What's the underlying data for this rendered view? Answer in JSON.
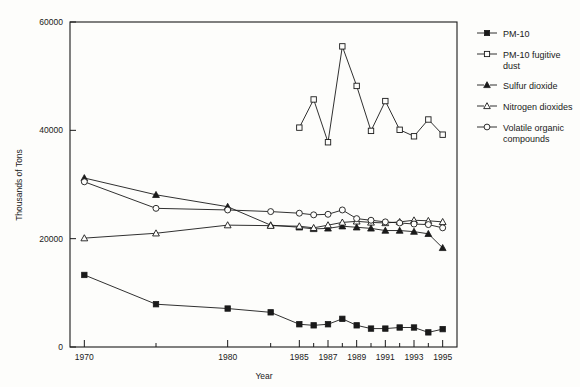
{
  "chart_data": {
    "type": "line",
    "title": "",
    "xlabel": "Year",
    "ylabel": "Thousands of Tons",
    "xlim": [
      1969,
      1996
    ],
    "ylim": [
      0,
      60000
    ],
    "yticks": [
      0,
      20000,
      40000,
      60000
    ],
    "ytick_labels": [
      "0",
      "20000",
      "40000",
      "60000"
    ],
    "xticks": [
      1970,
      1975,
      1980,
      1983,
      1985,
      1986,
      1987,
      1988,
      1989,
      1990,
      1991,
      1992,
      1993,
      1994,
      1995
    ],
    "xtick_labels": [
      "1970",
      "",
      "1980",
      "",
      "1985",
      "",
      "1987",
      "",
      "1989",
      "",
      "1991",
      "",
      "1993",
      "",
      "1995"
    ],
    "grid": false,
    "legend_position": "right",
    "series": [
      {
        "name": "PM-10",
        "marker": "filled-square",
        "x": [
          1970,
          1975,
          1980,
          1983,
          1985,
          1986,
          1987,
          1988,
          1989,
          1990,
          1991,
          1992,
          1993,
          1994,
          1995
        ],
        "values": [
          13300,
          7900,
          7100,
          6400,
          4200,
          4000,
          4200,
          5200,
          4000,
          3400,
          3400,
          3600,
          3600,
          2700,
          3300
        ]
      },
      {
        "name": "PM-10 fugitive dust",
        "marker": "open-square",
        "x": [
          1985,
          1986,
          1987,
          1988,
          1989,
          1990,
          1991,
          1992,
          1993,
          1994,
          1995
        ],
        "values": [
          40500,
          45700,
          37800,
          55500,
          48200,
          39900,
          45400,
          40100,
          38900,
          42000,
          39200
        ]
      },
      {
        "name": "Sulfur dioxide",
        "marker": "filled-triangle",
        "x": [
          1970,
          1975,
          1980,
          1983,
          1985,
          1986,
          1987,
          1988,
          1989,
          1990,
          1991,
          1992,
          1993,
          1994,
          1995
        ],
        "values": [
          31200,
          28100,
          25900,
          22500,
          22100,
          21800,
          21900,
          22300,
          22100,
          21900,
          21500,
          21500,
          21300,
          20900,
          18300
        ]
      },
      {
        "name": "Nitrogen dioxides",
        "marker": "open-triangle",
        "x": [
          1970,
          1975,
          1980,
          1983,
          1985,
          1986,
          1987,
          1988,
          1989,
          1990,
          1991,
          1992,
          1993,
          1994,
          1995
        ],
        "values": [
          20100,
          21000,
          22500,
          22400,
          22300,
          22000,
          22500,
          23000,
          23200,
          23000,
          22900,
          23100,
          23400,
          23300,
          23100
        ]
      },
      {
        "name": "Volatile organic compounds",
        "marker": "open-circle",
        "x": [
          1970,
          1975,
          1980,
          1983,
          1985,
          1986,
          1987,
          1988,
          1989,
          1990,
          1991,
          1992,
          1993,
          1994,
          1995
        ],
        "values": [
          30500,
          25600,
          25300,
          25000,
          24700,
          24400,
          24500,
          25300,
          23700,
          23400,
          23100,
          22900,
          22700,
          22600,
          22000
        ]
      }
    ]
  },
  "legend": {
    "items": [
      {
        "label": "PM-10",
        "marker": "filled-square"
      },
      {
        "label": "PM-10 fugitive dust",
        "marker": "open-square"
      },
      {
        "label": "Sulfur dioxide",
        "marker": "filled-triangle"
      },
      {
        "label": "Nitrogen dioxides",
        "marker": "open-triangle"
      },
      {
        "label": "Volatile organic compounds",
        "marker": "open-circle"
      }
    ]
  },
  "axes": {
    "y_title": "Thousands of Tons",
    "x_title": "Year"
  }
}
